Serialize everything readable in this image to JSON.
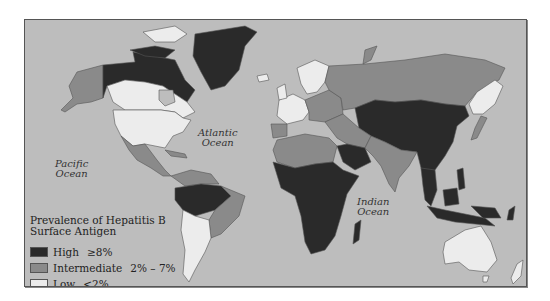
{
  "map": {
    "title": "Prevalence of Hepatitis B Surface Antigen",
    "title_line1": "Prevalence of Hepatitis B",
    "title_line2": "Surface Antigen",
    "ocean_labels": {
      "pacific": [
        "Pacific",
        "Ocean"
      ],
      "atlantic": [
        "Atlantic",
        "Ocean"
      ],
      "indian": [
        "Indian",
        "Ocean"
      ]
    },
    "legend": [
      {
        "label": "High",
        "range": "≥8%",
        "color": "#2a2a2a"
      },
      {
        "label": "Intermediate",
        "range": "2% – 7%",
        "color": "#8a8a8a"
      },
      {
        "label": "Low",
        "range": "<2%",
        "color": "#ececec"
      }
    ],
    "colors": {
      "ocean": "#bdbdbd",
      "high": "#2a2a2a",
      "intermediate": "#8a8a8a",
      "low": "#ececec",
      "border": "#555555"
    },
    "regions": {
      "high": [
        "Greenland",
        "Northern Canada",
        "China",
        "Mongolia",
        "Central Asia",
        "Southeast Asia",
        "Indonesia",
        "Philippines",
        "Sub-Saharan Africa",
        "Amazon Basin",
        "Saudi Arabia",
        "Madagascar"
      ],
      "intermediate": [
        "Alaska",
        "Russia",
        "Brazil (east)",
        "Mexico",
        "Central America",
        "North Africa",
        "Middle East",
        "India",
        "Eastern Europe",
        "Japan"
      ],
      "low": [
        "USA",
        "Southern Canada",
        "Western Europe",
        "Scandinavia",
        "Australia",
        "New Zealand",
        "Southern South America",
        "Northeast Asia coast"
      ]
    }
  }
}
